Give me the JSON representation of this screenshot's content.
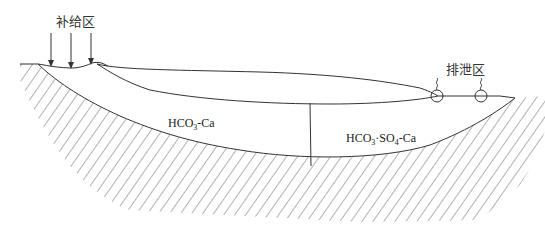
{
  "diagram": {
    "title": "",
    "labels": {
      "recharge_zone": "补给区",
      "discharge_zone": "排泄区",
      "water_type_1": {
        "main": "HCO",
        "sub": "3",
        "rest": "-Ca"
      },
      "water_type_2": {
        "main1": "HCO",
        "sub1": "3",
        "mid": "·SO",
        "sub2": "4",
        "rest": "-Ca"
      }
    },
    "elements": {
      "recharge_arrows_count": 3,
      "spring_symbols_count": 2,
      "hatched_layers": [
        "upper aquitard lens",
        "lower impermeable base"
      ],
      "aquifer_zones": [
        "HCO3-Ca zone",
        "HCO3·SO4-Ca zone"
      ]
    },
    "colors": {
      "line": "#333333",
      "hatch": "#555555",
      "background": "#ffffff"
    }
  }
}
